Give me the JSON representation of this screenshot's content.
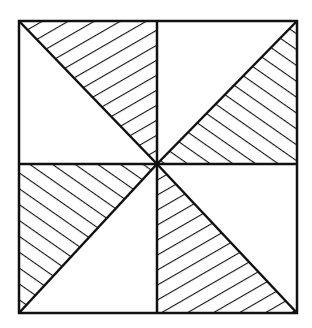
{
  "diagram": {
    "type": "geometric-pattern",
    "stroke_color": "#111111",
    "background": "#ffffff",
    "outer_square": {
      "x1": 19,
      "y1": 21,
      "x2": 297,
      "y2": 313
    },
    "center": {
      "x": 157,
      "y": 164
    },
    "hatched_triangles": [
      {
        "quadrant": "top-left",
        "region": "upper-right triangle",
        "hatch": "rising"
      },
      {
        "quadrant": "top-right",
        "region": "lower-right triangle",
        "hatch": "falling"
      },
      {
        "quadrant": "bottom-left",
        "region": "upper-left triangle",
        "hatch": "falling"
      },
      {
        "quadrant": "bottom-right",
        "region": "lower-left triangle",
        "hatch": "rising"
      }
    ]
  }
}
